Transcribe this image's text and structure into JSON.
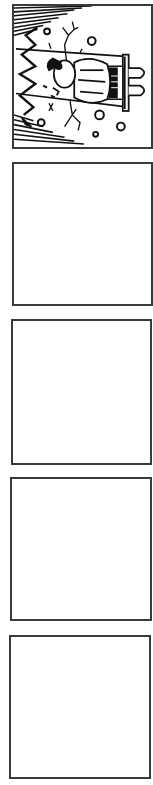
{
  "page": {
    "width": 153,
    "height": 785,
    "background": "#ffffff",
    "border_color": "#3a3a3a"
  },
  "panels": [
    {
      "index": 1,
      "content": "illustration",
      "description": "Rotated ink drawing of a girl in a dress lying on a bench/plank, zigzag shock lines on the left, hatched diagonal lines at top-left and bottom-left corners, branching crack lines, scattered small circles",
      "box": {
        "x": 12,
        "y": 4,
        "w": 141,
        "h": 145
      }
    },
    {
      "index": 2,
      "content": "empty",
      "box": {
        "x": 12,
        "y": 162,
        "w": 141,
        "h": 144
      }
    },
    {
      "index": 3,
      "content": "empty",
      "box": {
        "x": 11,
        "y": 319,
        "w": 141,
        "h": 146
      }
    },
    {
      "index": 4,
      "content": "empty",
      "box": {
        "x": 10,
        "y": 477,
        "w": 142,
        "h": 144
      }
    },
    {
      "index": 5,
      "content": "empty",
      "box": {
        "x": 9,
        "y": 635,
        "w": 142,
        "h": 144
      }
    }
  ]
}
